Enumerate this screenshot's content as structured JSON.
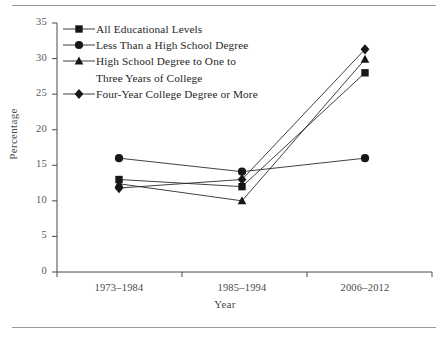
{
  "chart_data": {
    "type": "line",
    "title": "",
    "xlabel": "Year",
    "ylabel": "Percentage",
    "categories": [
      "1973–1984",
      "1985–1994",
      "2006–2012"
    ],
    "ylim": [
      0,
      35
    ],
    "yticks": [
      0,
      5,
      10,
      15,
      20,
      25,
      30,
      35
    ],
    "ytick_labels": [
      "0",
      "5",
      "10",
      "15",
      "20",
      "25",
      "30",
      "35"
    ],
    "grid": false,
    "legend_position": "upper-left",
    "series": [
      {
        "name": "All Educational Levels",
        "marker": "square",
        "values": [
          13.0,
          12.0,
          28.0
        ]
      },
      {
        "name": "Less Than a High School Degree",
        "marker": "circle",
        "values": [
          16.0,
          14.1,
          16.0
        ]
      },
      {
        "name": "High School Degree to One to Three Years of College",
        "marker": "triangle",
        "values": [
          12.4,
          10.0,
          29.9
        ]
      },
      {
        "name": "Four-Year College Degree or More",
        "marker": "diamond",
        "values": [
          11.8,
          13.0,
          31.3
        ]
      }
    ]
  },
  "legend": {
    "entries": [
      {
        "label": "All Educational Levels",
        "marker": "square",
        "continuation": ""
      },
      {
        "label": "Less Than a High School Degree",
        "marker": "circle",
        "continuation": ""
      },
      {
        "label": "High School Degree to One to",
        "marker": "triangle",
        "continuation": "Three Years of College"
      },
      {
        "label": "Four-Year College Degree or More",
        "marker": "diamond",
        "continuation": ""
      }
    ]
  },
  "axes": {
    "ylabel": "Percentage",
    "xlabel": "Year",
    "ytick_labels": [
      "35",
      "30",
      "25",
      "20",
      "15",
      "10",
      "5",
      "0"
    ],
    "xtick_labels": [
      "1973–1984",
      "1985–1994",
      "2006–2012"
    ]
  },
  "colors": {
    "marker": "#171717",
    "line": "#2b2b2b",
    "axis": "#4a4a4a",
    "tick_text": "#5a5a5a",
    "rule": "#9a9a9a"
  }
}
